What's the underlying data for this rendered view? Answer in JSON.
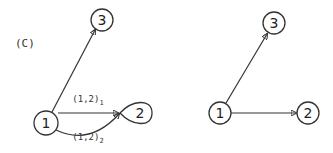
{
  "panel_label": "(C)",
  "left_graph": {
    "nodes": [
      {
        "id": "1",
        "label": "1"
      },
      {
        "id": "2",
        "label": "2"
      },
      {
        "id": "3",
        "label": "3"
      }
    ],
    "edges": [
      {
        "from": "1",
        "to": "3",
        "label": ""
      },
      {
        "from": "1",
        "to": "2",
        "label": "(1,2)",
        "subscript": "1"
      },
      {
        "from": "1",
        "to": "2",
        "label": "(1,2)",
        "subscript": "2"
      }
    ]
  },
  "right_graph": {
    "nodes": [
      {
        "id": "1",
        "label": "1"
      },
      {
        "id": "2",
        "label": "2"
      },
      {
        "id": "3",
        "label": "3"
      }
    ],
    "edges": [
      {
        "from": "1",
        "to": "3"
      },
      {
        "from": "1",
        "to": "2"
      }
    ]
  },
  "colors": {
    "stroke": "#333333",
    "background": "#ffffff"
  }
}
